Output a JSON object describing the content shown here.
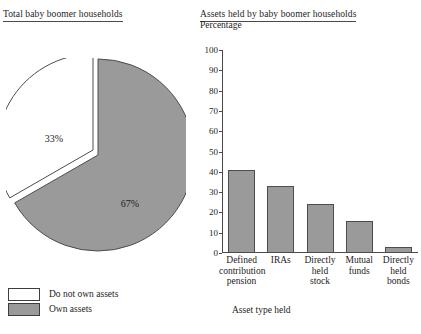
{
  "figure": {
    "left_title": "Total baby boomer households",
    "right_title": "Assets held by baby boomer households"
  },
  "pie": {
    "labels": [
      "33%",
      "67%"
    ],
    "legend": [
      {
        "label": "Do not own assets",
        "color": "#ffffff"
      },
      {
        "label": "Own assets",
        "color": "#9a9a9a"
      }
    ]
  },
  "bars": {
    "ylabel": "Percentage",
    "xlabel": "Asset type held",
    "yticks": [
      "0",
      "10",
      "20",
      "30",
      "40",
      "50",
      "60",
      "70",
      "80",
      "90",
      "100"
    ],
    "categories": [
      "Defined\ncontribution\npension",
      "IRAs",
      "Directly\nheld\nstock",
      "Mutual\nfunds",
      "Directly\nheld\nbonds"
    ]
  },
  "colors": {
    "fill": "#9a9a9a",
    "stroke": "#4c4c4c",
    "axis": "#4a4a4a",
    "text": "#1d1d1d"
  },
  "chart_data": [
    {
      "type": "pie",
      "title": "Total baby boomer households",
      "categories": [
        "Do not own assets",
        "Own assets"
      ],
      "values": [
        33,
        67
      ],
      "labels": [
        "33%",
        "67%"
      ],
      "colors": [
        "#ffffff",
        "#9a9a9a"
      ],
      "exploded_slice": "Do not own assets",
      "legend": "bottom-left",
      "units": "percent"
    },
    {
      "type": "bar",
      "title": "Assets held by baby boomer households",
      "categories": [
        "Defined contribution pension",
        "IRAs",
        "Directly held stock",
        "Mutual funds",
        "Directly held bonds"
      ],
      "values": [
        41,
        33,
        24,
        16,
        3
      ],
      "xlabel": "Asset type held",
      "ylabel": "Percentage",
      "ylim": [
        0,
        100
      ],
      "ytick_step": 10,
      "grid": false,
      "legend": "none",
      "series_color": "#9a9a9a"
    }
  ]
}
